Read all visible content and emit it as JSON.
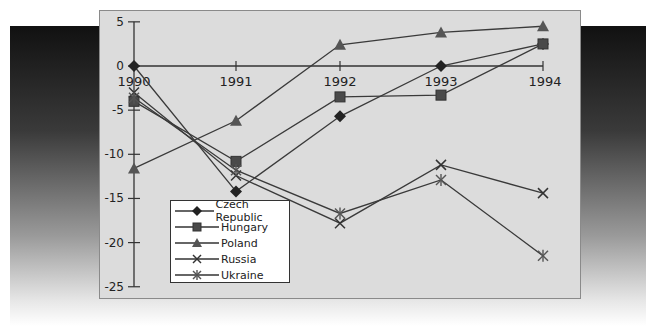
{
  "chart_data": {
    "type": "line",
    "title": "",
    "xlabel": "",
    "ylabel": "",
    "x": [
      "1990",
      "1991",
      "1992",
      "1993",
      "1994"
    ],
    "ylim": [
      -25,
      5
    ],
    "yticks": [
      5,
      0,
      -5,
      -10,
      -15,
      -20,
      -25
    ],
    "grid": false,
    "legend_position": "lower-left",
    "series": [
      {
        "name": "Czech Republic",
        "marker": "diamond",
        "values": [
          0,
          -14.2,
          -5.7,
          0,
          2.5
        ]
      },
      {
        "name": "Hungary",
        "marker": "square",
        "values": [
          -4,
          -10.8,
          -3.5,
          -3.3,
          2.5
        ]
      },
      {
        "name": "Poland",
        "marker": "triangle",
        "values": [
          -11.6,
          -6.2,
          2.4,
          3.8,
          4.5
        ]
      },
      {
        "name": "Russia",
        "marker": "x",
        "values": [
          -3,
          -12.4,
          -17.8,
          -11.2,
          -14.4
        ]
      },
      {
        "name": "Ukraine",
        "marker": "asterisk",
        "values": [
          -3.6,
          -11.8,
          -16.7,
          -12.9,
          -21.5
        ]
      }
    ]
  },
  "axis": {
    "y_labels": [
      "5",
      "0",
      "-5",
      "-10",
      "-15",
      "-20",
      "-25"
    ],
    "x_labels": [
      "1990",
      "1991",
      "1992",
      "1993",
      "1994"
    ]
  },
  "legend": {
    "items": [
      "Czech Republic",
      "Hungary",
      "Poland",
      "Russia",
      "Ukraine"
    ]
  }
}
